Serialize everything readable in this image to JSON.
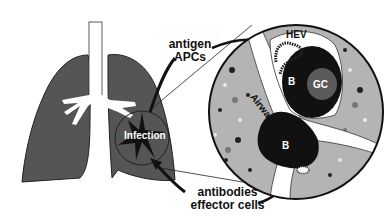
{
  "diagram": {
    "labels": {
      "antigen": "antigen",
      "apcs": "APCs",
      "antibodies": "antibodies",
      "effector_cells": "effector cells",
      "infection": "Infection"
    },
    "inset_labels": {
      "hev": "HEV",
      "t_zone": "T",
      "b_follicle_upper": "B",
      "germinal_center": "GC",
      "airway": "Airway",
      "b_follicle_lower": "B"
    },
    "colors": {
      "lung": "#555555",
      "inset_tissue": "#b4b4b4",
      "b_follicle": "#111111",
      "germinal_center": "#5a5a5a",
      "airway": "#ffffff"
    }
  }
}
